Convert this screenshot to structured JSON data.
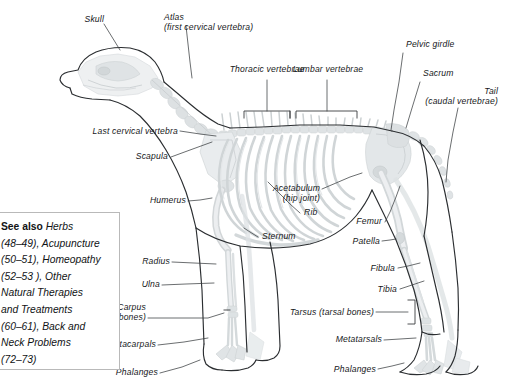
{
  "figure": {
    "background_color": "#ffffff",
    "outline_color": "#2b2e31",
    "bone_color": "#d9dcde",
    "leader_color": "#3a3d40",
    "text_color": "#16181a"
  },
  "see_also": {
    "lead_label": "See also",
    "body": " Herbs\n(48–49), Acupuncture\n(50–51), Homeopathy\n(52–53 ), Other\nNatural Therapies\nand Treatments\n(60–61), Back and\nNeck Problems\n(72–73)",
    "border_color": "#b9b9b9"
  },
  "labels": {
    "skull": "Skull",
    "atlas_line1": "Atlas",
    "atlas_line2": "(first cervical vertebra)",
    "thoracic_vertebrae": "Thoracic vertebrae",
    "lumbar_vertebrae": "Lumbar vertebrae",
    "pelvic_girdle": "Pelvic girdle",
    "sacrum": "Sacrum",
    "tail_line1": "Tail",
    "tail_line2": "(caudal vertebrae)",
    "last_cervical_vertebra": "Last cervical vertebra",
    "scapula": "Scapula",
    "humerus": "Humerus",
    "rib": "Rib",
    "sternum": "Sternum",
    "acetabulum_line1": "Acetabulum",
    "acetabulum_line2": "(hip joint)",
    "femur": "Femur",
    "patella": "Patella",
    "fibula": "Fibula",
    "tibia": "Tibia",
    "radius": "Radius",
    "ulna": "Ulna",
    "carpus_line1": "Carpus",
    "carpus_line2": "(carpal bones)",
    "metacarpals": "Metacarpals",
    "phalanges_front": "Phalanges",
    "tarsus": "Tarsus (tarsal bones)",
    "metatarsals": "Metatarsals",
    "phalanges_hind": "Phalanges"
  }
}
